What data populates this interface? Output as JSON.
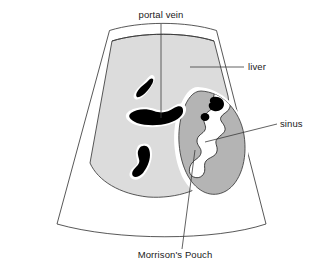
{
  "figure": {
    "type": "ultrasound-sector-diagram",
    "title": "",
    "background_color": "#ffffff"
  },
  "colors": {
    "liver_fill": "#dcdcdc",
    "kidney_fill": "#b4b4b4",
    "vessel_fill": "#000000",
    "sinus_fill": "#ffffff",
    "halo_fill": "#ffffff",
    "outline_stroke": "#3a3a3a",
    "leader_stroke": "#3a3a3a",
    "label_color": "#1a1a1a"
  },
  "labels": [
    {
      "id": "portal-vein",
      "text": "portal vein",
      "text_x": 161,
      "text_y": 18,
      "anchor": "middle"
    },
    {
      "id": "liver",
      "text": "liver",
      "text_x": 248,
      "text_y": 70,
      "anchor": "start"
    },
    {
      "id": "sinus",
      "text": "sinus",
      "text_x": 280,
      "text_y": 127,
      "anchor": "start"
    },
    {
      "id": "morrisons-pouch",
      "text": "Morrison's Pouch",
      "text_x": 175,
      "text_y": 258,
      "anchor": "middle"
    }
  ],
  "structures": [
    {
      "id": "scan-sector",
      "name": "ultrasound scan sector outline"
    },
    {
      "id": "liver-region",
      "name": "liver parenchyma"
    },
    {
      "id": "kidney-region",
      "name": "right kidney"
    },
    {
      "id": "renal-sinus",
      "name": "renal sinus"
    },
    {
      "id": "portal-vein-branch-upper",
      "name": "portal vein branch upper"
    },
    {
      "id": "portal-vein-main",
      "name": "portal vein main"
    },
    {
      "id": "portal-vein-branch-lower",
      "name": "portal vein branch lower"
    },
    {
      "id": "sinus-vessel-large",
      "name": "sinus vessel large"
    },
    {
      "id": "sinus-vessel-small",
      "name": "sinus vessel small"
    },
    {
      "id": "morrisons-pouch-space",
      "name": "hepatorenal recess"
    }
  ]
}
